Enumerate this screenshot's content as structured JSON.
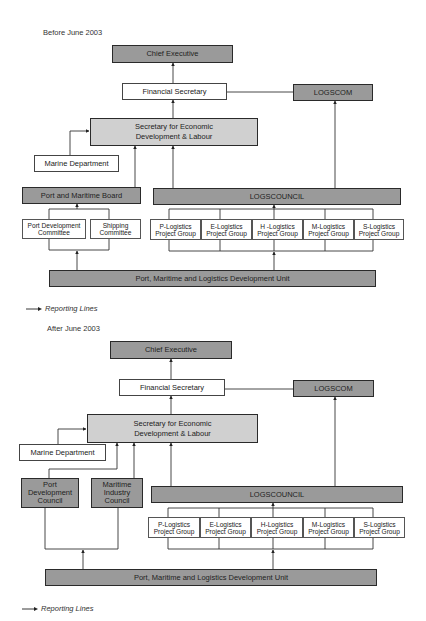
{
  "before": {
    "caption": "Before June 2003",
    "chief_executive": "Chief Executive",
    "financial_secretary": "Financial Secretary",
    "logscom": "LOGSCOM",
    "secretary": "Secretary for Economic\nDevelopment & Labour",
    "marine_department": "Marine Department",
    "port_maritime_board": "Port and Maritime Board",
    "logscouncil": "LOGSCOUNCIL",
    "port_development_committee": "Port Development\nCommittee",
    "shipping_committee": "Shipping\nCommittee",
    "project_groups": [
      "P-Logistics\nProject Group",
      "E-Logistics\nProject Group",
      "H -Logistics\nProject Group",
      "M-Logistics\nProject Group",
      "S-Logistics\nProject Group"
    ],
    "pmldu": "Port, Maritime and Logistics Development Unit",
    "legend": "Reporting Lines"
  },
  "after": {
    "caption": "After June 2003",
    "chief_executive": "Chief Executive",
    "financial_secretary": "Financial Secretary",
    "logscom": "LOGSCOM",
    "secretary": "Secretary for Economic\nDevelopment & Labour",
    "marine_department": "Marine Department",
    "port_development_council": "Port\nDevelopment\nCouncil",
    "maritime_industry_council": "Maritime\nIndustry\nCouncil",
    "logscouncil": "LOGSCOUNCIL",
    "project_groups": [
      "P-Logistics\nProject Group",
      "E-Logistics\nProject Group",
      "H-Logistics\nProject Group",
      "M-Logistics\nProject Group",
      "S-Logistics\nProject Group"
    ],
    "pmldu": "Port, Maritime and Logistics Development Unit",
    "legend": "Reporting Lines"
  },
  "colors": {
    "dark_box": "#9a9a9a",
    "light_box": "#d0d0d0",
    "white_box": "#ffffff",
    "line": "#333333"
  }
}
